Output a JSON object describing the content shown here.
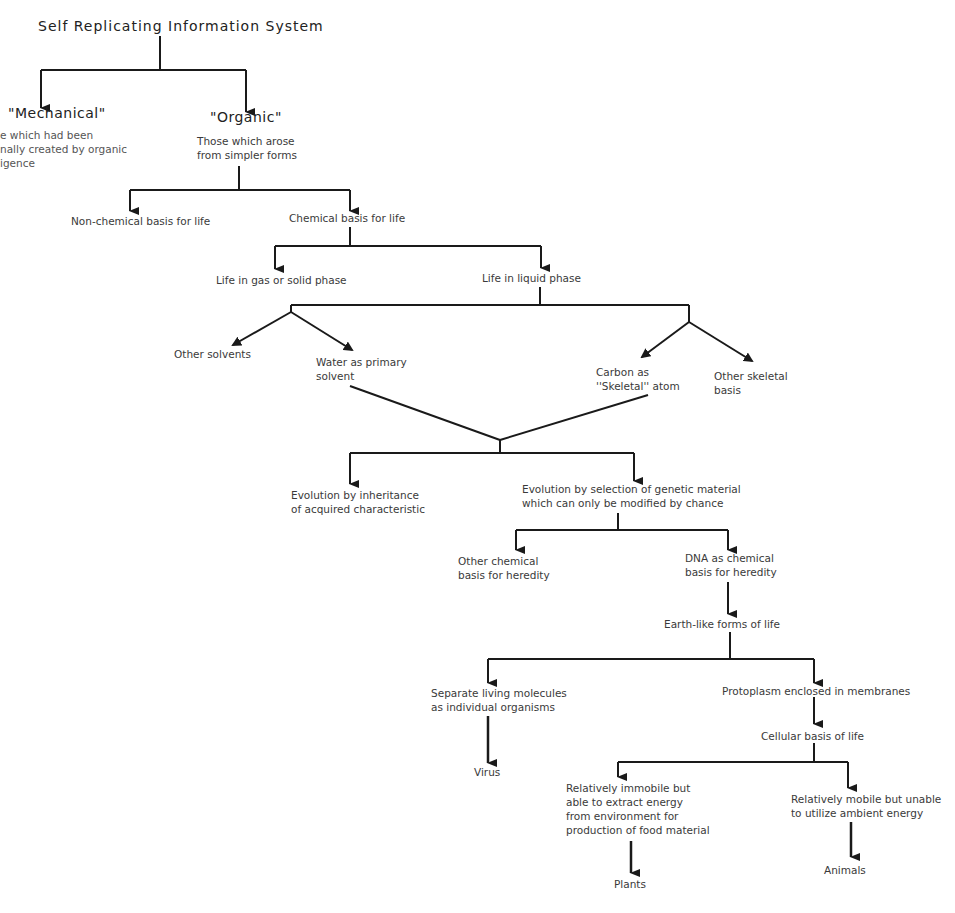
{
  "diagram": {
    "title": "Self Replicating Information System",
    "nodes": {
      "mechanical": {
        "label": "\"Mechanical\"",
        "desc": "e which had been\nnally created by organic\nigence"
      },
      "organic": {
        "label": "\"Organic\"",
        "desc": "Those which arose\nfrom simpler forms"
      },
      "non_chemical": {
        "label": "Non-chemical basis for life"
      },
      "chemical": {
        "label": "Chemical basis for life"
      },
      "gas_solid": {
        "label": "Life in gas or solid phase"
      },
      "liquid": {
        "label": "Life in liquid phase"
      },
      "other_solvents": {
        "label": "Other solvents"
      },
      "water": {
        "label": "Water as primary\nsolvent"
      },
      "carbon": {
        "label": "Carbon as\n''Skeletal'' atom"
      },
      "other_skeletal": {
        "label": "Other skeletal\nbasis"
      },
      "inheritance": {
        "label": "Evolution by inheritance\nof acquired characteristic"
      },
      "selection": {
        "label": "Evolution by selection of genetic material\nwhich can only be modified by chance"
      },
      "other_chemical_heredity": {
        "label": "Other chemical\nbasis for heredity"
      },
      "dna": {
        "label": "DNA as chemical\nbasis for heredity"
      },
      "earth_like": {
        "label": "Earth-like forms of life"
      },
      "separate_molecules": {
        "label": "Separate living molecules\nas individual organisms"
      },
      "protoplasm": {
        "label": "Protoplasm enclosed in membranes"
      },
      "virus": {
        "label": "Virus"
      },
      "cellular": {
        "label": "Cellular basis of life"
      },
      "immobile": {
        "label": "Relatively immobile but\nable to extract energy\nfrom environment for\nproduction of food material"
      },
      "mobile": {
        "label": "Relatively mobile but unable\nto utilize ambient energy"
      },
      "plants": {
        "label": "Plants"
      },
      "animals": {
        "label": "Animals"
      }
    },
    "colors": {
      "line": "#1a1a1a",
      "text": "#3a3a3a"
    }
  }
}
